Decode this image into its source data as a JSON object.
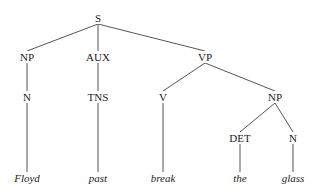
{
  "tree": {
    "nodes": [
      {
        "id": "S",
        "label": "S",
        "x": 98,
        "y": 18,
        "leaf": false
      },
      {
        "id": "NP1",
        "label": "NP",
        "x": 27,
        "y": 57,
        "leaf": false
      },
      {
        "id": "AUX",
        "label": "AUX",
        "x": 98,
        "y": 57,
        "leaf": false
      },
      {
        "id": "VP",
        "label": "VP",
        "x": 205,
        "y": 57,
        "leaf": false
      },
      {
        "id": "N1",
        "label": "N",
        "x": 27,
        "y": 97,
        "leaf": false
      },
      {
        "id": "TNS",
        "label": "TNS",
        "x": 98,
        "y": 97,
        "leaf": false
      },
      {
        "id": "V",
        "label": "V",
        "x": 163,
        "y": 97,
        "leaf": false
      },
      {
        "id": "NP2",
        "label": "NP",
        "x": 275,
        "y": 97,
        "leaf": false
      },
      {
        "id": "DET",
        "label": "DET",
        "x": 240,
        "y": 138,
        "leaf": false
      },
      {
        "id": "N2",
        "label": "N",
        "x": 293,
        "y": 138,
        "leaf": false
      },
      {
        "id": "w1",
        "label": "Floyd",
        "x": 27,
        "y": 178,
        "leaf": true
      },
      {
        "id": "w2",
        "label": "past",
        "x": 98,
        "y": 178,
        "leaf": true
      },
      {
        "id": "w3",
        "label": "break",
        "x": 163,
        "y": 178,
        "leaf": true
      },
      {
        "id": "w4",
        "label": "the",
        "x": 240,
        "y": 178,
        "leaf": true
      },
      {
        "id": "w5",
        "label": "glass",
        "x": 293,
        "y": 178,
        "leaf": true
      }
    ],
    "edges": [
      [
        "S",
        "NP1"
      ],
      [
        "S",
        "AUX"
      ],
      [
        "S",
        "VP"
      ],
      [
        "NP1",
        "N1"
      ],
      [
        "AUX",
        "TNS"
      ],
      [
        "VP",
        "V"
      ],
      [
        "VP",
        "NP2"
      ],
      [
        "NP2",
        "DET"
      ],
      [
        "NP2",
        "N2"
      ],
      [
        "N1",
        "w1"
      ],
      [
        "TNS",
        "w2"
      ],
      [
        "V",
        "w3"
      ],
      [
        "DET",
        "w4"
      ],
      [
        "N2",
        "w5"
      ]
    ],
    "line_color": "#555555"
  }
}
